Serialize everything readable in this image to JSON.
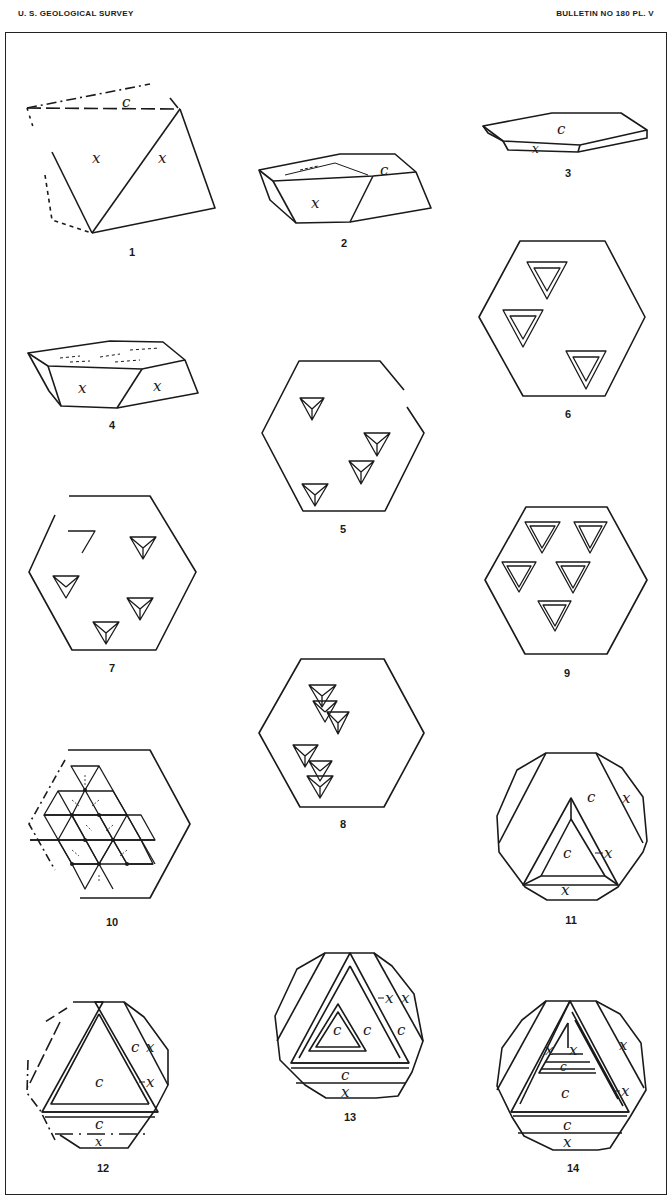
{
  "header": {
    "left": "U. S. GEOLOGICAL SURVEY",
    "right": "BULLETIN NO 180   PL. V"
  },
  "figures": [
    {
      "number": "1",
      "labels": [
        "c",
        "x",
        "x"
      ]
    },
    {
      "number": "2",
      "labels": [
        "c",
        "x"
      ]
    },
    {
      "number": "3",
      "labels": [
        "c",
        "x"
      ]
    },
    {
      "number": "4",
      "labels": [
        "x",
        "x"
      ]
    },
    {
      "number": "5",
      "labels": []
    },
    {
      "number": "6",
      "labels": []
    },
    {
      "number": "7",
      "labels": []
    },
    {
      "number": "8",
      "labels": []
    },
    {
      "number": "9",
      "labels": []
    },
    {
      "number": "10",
      "labels": []
    },
    {
      "number": "11",
      "labels": [
        "c",
        "x",
        "c",
        "x",
        "x"
      ]
    },
    {
      "number": "12",
      "labels": [
        "c",
        "x",
        "x",
        "c",
        "c",
        "x"
      ]
    },
    {
      "number": "13",
      "labels": [
        "x",
        "x",
        "c",
        "c",
        "c",
        "c",
        "x"
      ]
    },
    {
      "number": "14",
      "labels": [
        "x",
        "x",
        "x",
        "c",
        "c",
        "x",
        "c",
        "x"
      ]
    }
  ],
  "colors": {
    "ink": "#1a1a1a",
    "paper": "#ffffff"
  }
}
